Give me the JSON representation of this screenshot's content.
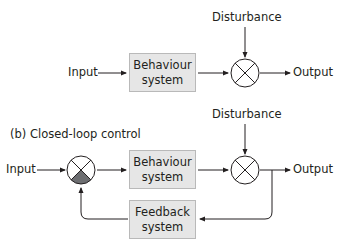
{
  "open_loop": {
    "disturbance_label": "Disturbance",
    "input_label": "Input",
    "output_label": "Output",
    "behaviour_box": {
      "line1": "Behaviour",
      "line2": "system"
    }
  },
  "closed_loop": {
    "title": "(b) Closed-loop control",
    "disturbance_label": "Disturbance",
    "input_label": "Input",
    "output_label": "Output",
    "behaviour_box": {
      "line1": "Behaviour",
      "line2": "system"
    },
    "feedback_box": {
      "line1": "Feedback",
      "line2": "system"
    }
  },
  "colors": {
    "box_fill": "#e6e6e6",
    "box_border": "#b9b9b9",
    "line": "#231f20",
    "comparator_fill": "#6d6e71"
  }
}
